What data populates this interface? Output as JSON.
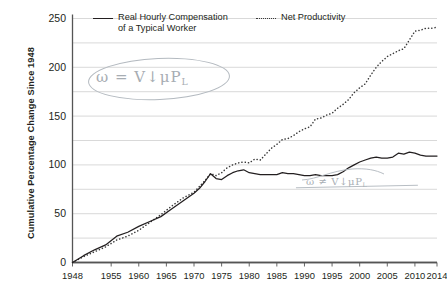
{
  "chart_data": {
    "type": "line",
    "title": "",
    "xlabel": "",
    "ylabel": "Cumulative Percentage Change Since 1948",
    "xlim": [
      1948,
      2014
    ],
    "ylim": [
      0,
      250
    ],
    "ytick_values": [
      0,
      50,
      100,
      150,
      200,
      250
    ],
    "ytick_labels": [
      "0",
      "50",
      "100",
      "150",
      "200",
      "250"
    ],
    "gridline_values": [
      0,
      25,
      50,
      75,
      100,
      125,
      150,
      175,
      200,
      225,
      250
    ],
    "grid": true,
    "xtick_values": [
      1948,
      1955,
      1960,
      1965,
      1970,
      1975,
      1980,
      1985,
      1990,
      1995,
      2000,
      2005,
      2010,
      2014
    ],
    "xtick_labels": [
      "1948",
      "1955",
      "1960",
      "1965",
      "1970",
      "1975",
      "1980",
      "1985",
      "1990",
      "1995",
      "2000",
      "2005",
      "2010",
      "2014"
    ],
    "legend_position": "top",
    "series": [
      {
        "name": "Real Hourly Compensation of a Typical Worker",
        "style": "solid",
        "color": "#231f20",
        "x": [
          1948,
          1950,
          1952,
          1954,
          1956,
          1958,
          1960,
          1962,
          1964,
          1966,
          1968,
          1970,
          1971,
          1972,
          1973,
          1974,
          1975,
          1976,
          1977,
          1978,
          1979,
          1980,
          1981,
          1982,
          1983,
          1984,
          1985,
          1986,
          1987,
          1988,
          1989,
          1990,
          1991,
          1992,
          1993,
          1994,
          1995,
          1996,
          1997,
          1998,
          1999,
          2000,
          2001,
          2002,
          2003,
          2004,
          2005,
          2006,
          2007,
          2008,
          2009,
          2010,
          2011,
          2012,
          2013,
          2014
        ],
        "values": [
          0,
          7,
          13,
          18,
          27,
          31,
          37,
          42,
          47,
          55,
          63,
          71,
          76,
          83,
          91,
          86,
          85,
          89,
          92,
          94,
          95,
          92,
          91,
          90,
          90,
          90,
          90,
          92,
          91,
          91,
          90,
          89,
          89,
          90,
          89,
          89,
          89,
          90,
          93,
          97,
          100,
          103,
          105,
          107,
          108,
          107,
          107,
          108,
          112,
          111,
          113,
          112,
          110,
          109,
          109,
          109
        ]
      },
      {
        "name": "Net Productivity",
        "style": "dotted",
        "color": "#3b3b3b",
        "x": [
          1948,
          1950,
          1952,
          1954,
          1956,
          1958,
          1960,
          1962,
          1964,
          1966,
          1968,
          1970,
          1971,
          1972,
          1973,
          1974,
          1975,
          1976,
          1977,
          1978,
          1979,
          1980,
          1981,
          1982,
          1983,
          1984,
          1985,
          1986,
          1987,
          1988,
          1989,
          1990,
          1991,
          1992,
          1993,
          1994,
          1995,
          1996,
          1997,
          1998,
          1999,
          2000,
          2001,
          2002,
          2003,
          2004,
          2005,
          2006,
          2007,
          2008,
          2009,
          2010,
          2011,
          2012,
          2013,
          2014
        ],
        "values": [
          0,
          6,
          11,
          16,
          23,
          27,
          33,
          41,
          49,
          58,
          66,
          72,
          78,
          84,
          91,
          89,
          92,
          97,
          100,
          102,
          103,
          102,
          106,
          105,
          111,
          117,
          121,
          126,
          127,
          130,
          134,
          137,
          139,
          147,
          148,
          151,
          153,
          158,
          162,
          167,
          174,
          179,
          183,
          192,
          200,
          206,
          211,
          214,
          217,
          219,
          228,
          237,
          238,
          240,
          240,
          241
        ]
      }
    ]
  },
  "legend": {
    "entries": [
      {
        "label": "Real Hourly Compensation\nof a Typical Worker",
        "style": "solid"
      },
      {
        "label": "Net Productivity",
        "style": "dotted"
      }
    ]
  },
  "annotations": {
    "top": {
      "text": "ω = V↓μP",
      "subscript": "L",
      "circled": true
    },
    "bottom": {
      "text": "ω ≠ V↓μP",
      "subscript": "L",
      "circled": false
    }
  }
}
